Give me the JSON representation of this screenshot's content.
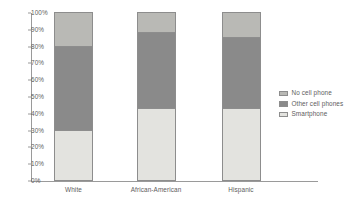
{
  "chart_data": {
    "type": "bar",
    "subtype": "100% stacked bar",
    "title": "",
    "subtitle": "",
    "xlabel": "",
    "ylabel": "",
    "categories": [
      "White",
      "African-American",
      "Hispanic"
    ],
    "series": [
      {
        "name": "Smartphone",
        "values": [
          30,
          43,
          43
        ],
        "color": "#e3e3df"
      },
      {
        "name": "Other cell phones",
        "values": [
          50,
          45,
          42
        ],
        "color": "#8a8a8a"
      },
      {
        "name": "No cell phone",
        "values": [
          20,
          12,
          15
        ],
        "color": "#b9b9b5"
      }
    ],
    "stack_order_bottom_to_top": [
      "Smartphone",
      "Other cell phones",
      "No cell phone"
    ],
    "ylim": [
      0,
      100
    ],
    "ytick_values": [
      0,
      10,
      20,
      30,
      40,
      50,
      60,
      70,
      80,
      90,
      100
    ],
    "ytick_labels": [
      "0%",
      "10%",
      "20%",
      "30%",
      "40%",
      "50%",
      "60%",
      "70%",
      "80%",
      "90%",
      "100%"
    ],
    "y_tick_suffix": "%",
    "grid": false,
    "legend_position": "right",
    "legend_entries": [
      "No cell phone",
      "Other cell phones",
      "Smartphone"
    ],
    "annotations": [],
    "axis_color": "#9a9a9a",
    "bar_border_color": "#8d8d8d",
    "text_color": "#5d5d5d",
    "background_color": "#ffffff",
    "stacked_tops": {
      "White": {
        "Smartphone": 30,
        "Other cell phones": 80,
        "No cell phone": 100
      },
      "African-American": {
        "Smartphone": 43,
        "Other cell phones": 88,
        "No cell phone": 100
      },
      "Hispanic": {
        "Smartphone": 43,
        "Other cell phones": 85,
        "No cell phone": 100
      }
    }
  },
  "legend": {
    "items": [
      {
        "label": "No cell phone"
      },
      {
        "label": "Other cell phones"
      },
      {
        "label": "Smartphone"
      }
    ]
  }
}
